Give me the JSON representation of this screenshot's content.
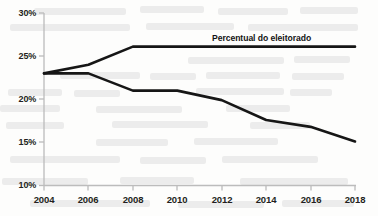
{
  "chart_data": {
    "type": "line",
    "title": "",
    "xlabel": "",
    "ylabel": "",
    "x": [
      2004,
      2006,
      2008,
      2010,
      2012,
      2014,
      2016,
      2018
    ],
    "xtick_labels": [
      "2004",
      "2006",
      "2008",
      "2010",
      "2012",
      "2014",
      "2016",
      "2018"
    ],
    "ytick_labels": [
      "30%",
      "25%",
      "20%",
      "15%",
      "10%"
    ],
    "yticks": [
      30,
      25,
      20,
      15,
      10
    ],
    "ylim": [
      10,
      30
    ],
    "xlim": [
      2004,
      2018
    ],
    "grid": false,
    "legend_position": "inline-annotation",
    "series": [
      {
        "name": "Percentual do eleitorado",
        "label": "Percentual do eleitorado",
        "color": "#161616",
        "values": [
          23.0,
          24.0,
          26.1,
          26.1,
          26.1,
          26.1,
          26.1,
          26.1
        ]
      },
      {
        "name": "serie-inferior",
        "label": "",
        "color": "#161616",
        "values": [
          23.0,
          23.0,
          21.0,
          21.0,
          19.9,
          17.6,
          16.8,
          15.1
        ]
      }
    ],
    "annotations": [
      {
        "text": "Percentual do eleitorado",
        "x": 2012.2,
        "y": 27.6
      }
    ]
  },
  "axis": {
    "y_axis_color": "#b9b9b9",
    "x_axis_color": "#b9b9b9",
    "tick_color": "#b9b9b9"
  }
}
